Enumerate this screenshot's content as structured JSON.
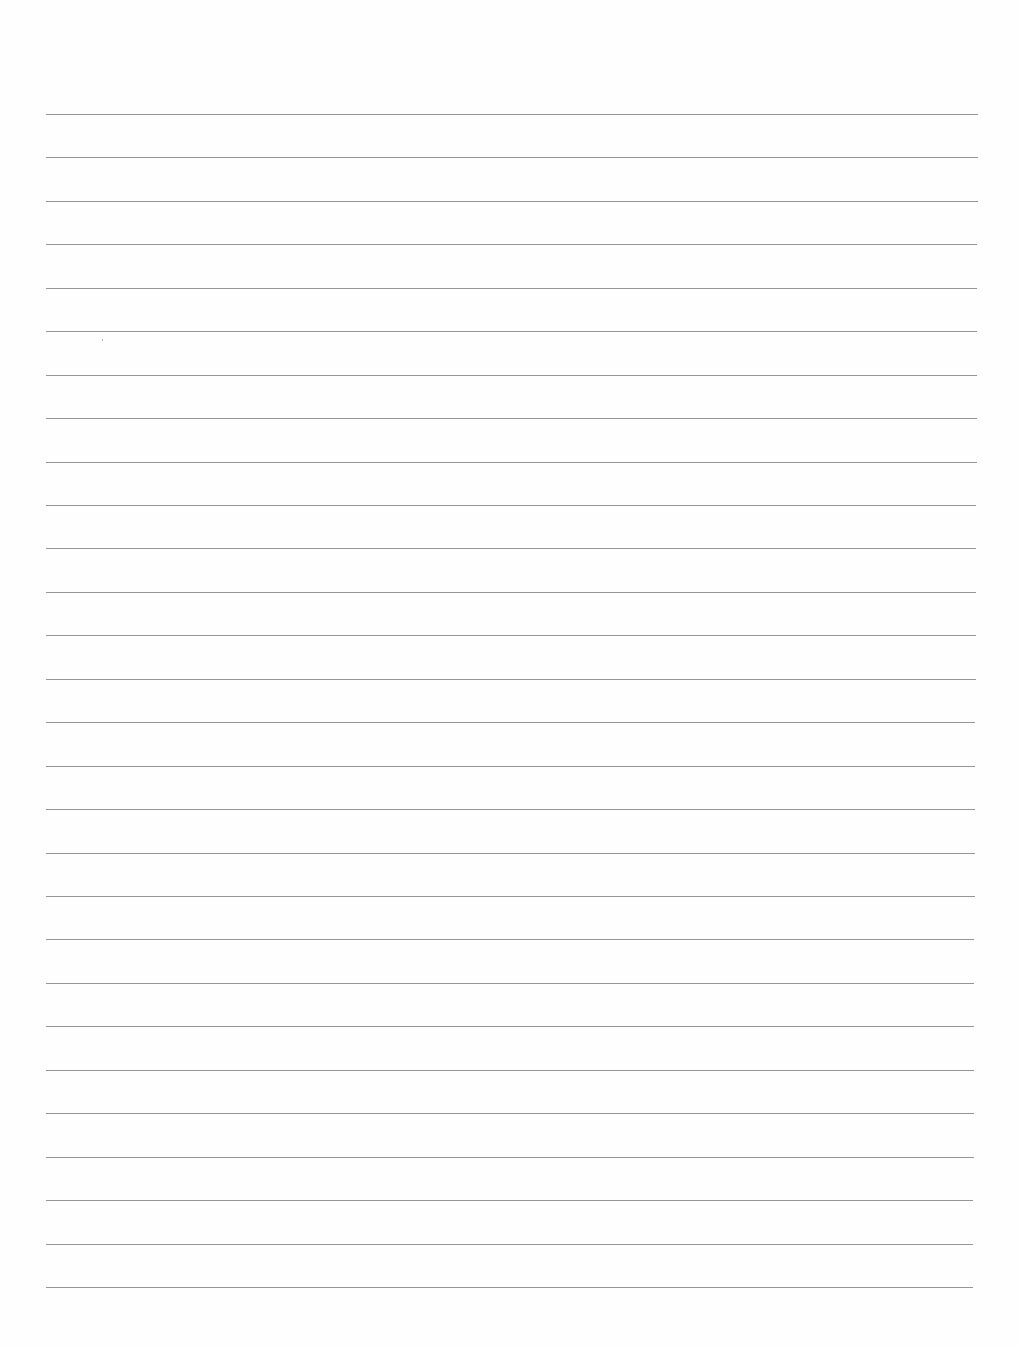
{
  "page": {
    "type": "blank lined paper",
    "background_color": "#ffffff",
    "line_color": "#8a8a8a",
    "line_count": 28,
    "first_line_y": 114,
    "last_line_y": 1287,
    "line_left_x": 46,
    "line_right_x_top": 978,
    "line_right_x_bottom": 973
  }
}
